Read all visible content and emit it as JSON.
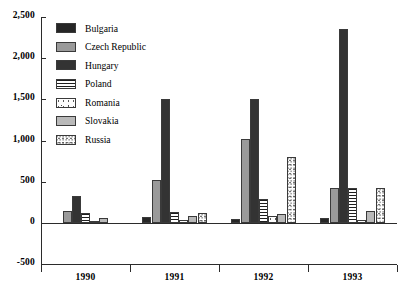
{
  "chart_data": {
    "type": "bar",
    "title": "",
    "subtitle": "",
    "xlabel": "",
    "ylabel": "",
    "categories": [
      "1990",
      "1991",
      "1992",
      "1993"
    ],
    "ylim": [
      -500,
      2500
    ],
    "yticks": [
      -500,
      0,
      500,
      1000,
      1500,
      2000,
      2500
    ],
    "ytick_labels": [
      "-500",
      "0",
      "500",
      "1,000",
      "1,500",
      "2,000",
      "2,500"
    ],
    "grid": false,
    "legend_position": "upper-left-inside",
    "series": [
      {
        "name": "Bulgaria",
        "values": [
          0,
          70,
          50,
          60
        ],
        "color": "#262626",
        "pattern": "solid-black"
      },
      {
        "name": "Czech Republic",
        "values": [
          150,
          520,
          1020,
          430
        ],
        "color": "#9a9a9a",
        "pattern": "solid-gray"
      },
      {
        "name": "Hungary",
        "values": [
          330,
          1500,
          1510,
          2350
        ],
        "color": "#333333",
        "pattern": "solid-dark"
      },
      {
        "name": "Poland",
        "values": [
          120,
          130,
          290,
          420
        ],
        "color": "#1f1f1f",
        "pattern": "horizontal-stripes"
      },
      {
        "name": "Romania",
        "values": [
          15,
          40,
          90,
          40
        ],
        "color": "#fdfdfd",
        "pattern": "sparse-speckle"
      },
      {
        "name": "Slovakia",
        "values": [
          60,
          90,
          110,
          150
        ],
        "color": "#b9b9b9",
        "pattern": "solid-light-gray"
      },
      {
        "name": "Russia",
        "values": [
          0,
          120,
          800,
          420
        ],
        "color": "#fefefe",
        "pattern": "fine-dots"
      }
    ]
  },
  "legend": {
    "items": [
      {
        "label": "Bulgaria"
      },
      {
        "label": "Czech Republic"
      },
      {
        "label": "Hungary"
      },
      {
        "label": "Poland"
      },
      {
        "label": "Romania"
      },
      {
        "label": "Slovakia"
      },
      {
        "label": "Russia"
      }
    ]
  }
}
